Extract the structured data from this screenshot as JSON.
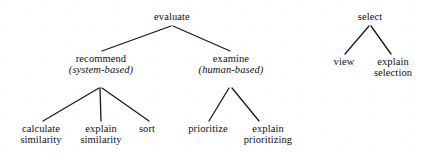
{
  "diagram": {
    "type": "tree",
    "title": "",
    "line_color": "#1a1a1a",
    "text_color": "#101010",
    "background": "#ffffff",
    "trees": [
      {
        "name": "evaluate-tree",
        "root": "evaluate"
      },
      {
        "name": "select-tree",
        "root": "select"
      }
    ],
    "nodes": [
      {
        "id": "evaluate",
        "label": "evaluate",
        "sub": "",
        "line2": "",
        "x": 172,
        "y": 12,
        "level": 0,
        "tree": "evaluate-tree"
      },
      {
        "id": "recommend",
        "label": "recommend",
        "sub": "(system-based)",
        "line2": "",
        "x": 101,
        "y": 54,
        "level": 1,
        "tree": "evaluate-tree"
      },
      {
        "id": "examine",
        "label": "examine",
        "sub": "(human-based)",
        "line2": "",
        "x": 231,
        "y": 54,
        "level": 1,
        "tree": "evaluate-tree"
      },
      {
        "id": "calculate-similarity",
        "label": "calculate",
        "sub": "",
        "line2": "similarity",
        "x": 41,
        "y": 124,
        "level": 2,
        "tree": "evaluate-tree"
      },
      {
        "id": "explain-similarity",
        "label": "explain",
        "sub": "",
        "line2": "similarity",
        "x": 101,
        "y": 124,
        "level": 2,
        "tree": "evaluate-tree"
      },
      {
        "id": "sort",
        "label": "sort",
        "sub": "",
        "line2": "",
        "x": 147,
        "y": 124,
        "level": 2,
        "tree": "evaluate-tree"
      },
      {
        "id": "prioritize",
        "label": "prioritize",
        "sub": "",
        "line2": "",
        "x": 208,
        "y": 124,
        "level": 2,
        "tree": "evaluate-tree"
      },
      {
        "id": "explain-prioritizing",
        "label": "explain",
        "sub": "",
        "line2": "prioritizing",
        "x": 268,
        "y": 124,
        "level": 2,
        "tree": "evaluate-tree"
      },
      {
        "id": "select",
        "label": "select",
        "sub": "",
        "line2": "",
        "x": 370,
        "y": 12,
        "level": 0,
        "tree": "select-tree"
      },
      {
        "id": "view",
        "label": "view",
        "sub": "",
        "line2": "",
        "x": 344,
        "y": 57,
        "level": 1,
        "tree": "select-tree"
      },
      {
        "id": "explain-selection",
        "label": "explain",
        "sub": "",
        "line2": "selection",
        "x": 393,
        "y": 57,
        "level": 1,
        "tree": "select-tree"
      }
    ],
    "edges": [
      {
        "from": "evaluate",
        "to": "recommend",
        "x1": 171,
        "y1": 26,
        "x2": 102,
        "y2": 51
      },
      {
        "from": "evaluate",
        "to": "examine",
        "x1": 173,
        "y1": 26,
        "x2": 230,
        "y2": 51
      },
      {
        "from": "recommend",
        "to": "calculate-similarity",
        "x1": 99,
        "y1": 88,
        "x2": 43,
        "y2": 121
      },
      {
        "from": "recommend",
        "to": "explain-similarity",
        "x1": 100,
        "y1": 88,
        "x2": 101,
        "y2": 121
      },
      {
        "from": "recommend",
        "to": "sort",
        "x1": 102,
        "y1": 88,
        "x2": 149,
        "y2": 121
      },
      {
        "from": "examine",
        "to": "prioritize",
        "x1": 229,
        "y1": 88,
        "x2": 209,
        "y2": 121
      },
      {
        "from": "examine",
        "to": "explain-prioritizing",
        "x1": 232,
        "y1": 88,
        "x2": 259,
        "y2": 121
      },
      {
        "from": "select",
        "to": "view",
        "x1": 369,
        "y1": 26,
        "x2": 345,
        "y2": 54
      },
      {
        "from": "select",
        "to": "explain-selection",
        "x1": 371,
        "y1": 26,
        "x2": 391,
        "y2": 54
      }
    ]
  }
}
